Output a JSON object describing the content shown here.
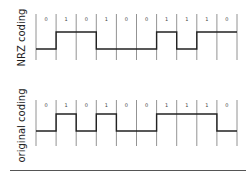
{
  "diagram": {
    "panels": [
      {
        "label": "NRZ coding",
        "bits": [
          "0",
          "1",
          "0",
          "1",
          "0",
          "0",
          "1",
          "1",
          "1",
          "0"
        ],
        "levels": [
          0,
          1,
          1,
          0,
          0,
          0,
          1,
          0,
          1,
          1
        ],
        "y_top": 14,
        "y_bottom": 60,
        "y_high": 32,
        "y_low": 49,
        "bit_label_y": 21,
        "label_center_y": 38
      },
      {
        "label": "original coding",
        "bits": [
          "0",
          "1",
          "0",
          "1",
          "0",
          "0",
          "1",
          "1",
          "1",
          "0"
        ],
        "levels": [
          0,
          1,
          0,
          1,
          0,
          0,
          1,
          1,
          1,
          0
        ],
        "y_top": 100,
        "y_bottom": 146,
        "y_high": 114,
        "y_low": 131,
        "bit_label_y": 107,
        "label_center_y": 126
      }
    ],
    "x_start": 36,
    "bit_width": 20.1,
    "colors": {
      "signal": "#222222",
      "gridline": "#777777",
      "text": "#444444"
    }
  }
}
